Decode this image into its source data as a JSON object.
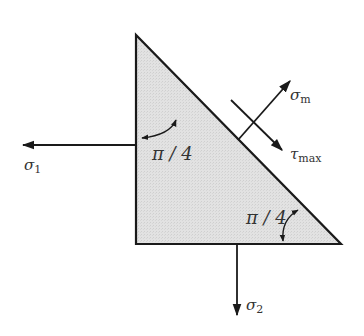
{
  "diagram": {
    "type": "stress-element-wedge",
    "colors": {
      "fill": "#dcdcdc",
      "stroke": "#1a1a1a",
      "text": "#333333"
    },
    "labels": {
      "sigma1": "σ",
      "sigma1_sub": "1",
      "sigma2": "σ",
      "sigma2_sub": "2",
      "sigma_m": "σ",
      "sigma_m_sub": "m",
      "tau_max": "τ",
      "tau_max_sub": "max",
      "angle_top": "π / 4",
      "angle_bottom": "π / 4"
    }
  }
}
